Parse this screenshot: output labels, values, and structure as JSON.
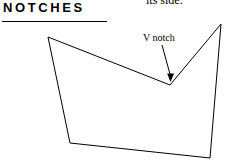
{
  "heading": {
    "text": "NOTCHES"
  },
  "body_text": {
    "clipped_line": "its side."
  },
  "annotation": {
    "label": "V notch"
  },
  "figure": {
    "stroke_color": "#000000",
    "stroke_width": 1,
    "fill": "none",
    "polygon_points": "48,37 170,85 221,24 210,158 70,143",
    "arrow_line": {
      "x1": 162,
      "y1": 45,
      "x2": 170.5,
      "y2": 76
    },
    "arrow_head": "170.5,82 167.2,73.4 174,73.4"
  },
  "rule": {
    "color": "#000000"
  }
}
